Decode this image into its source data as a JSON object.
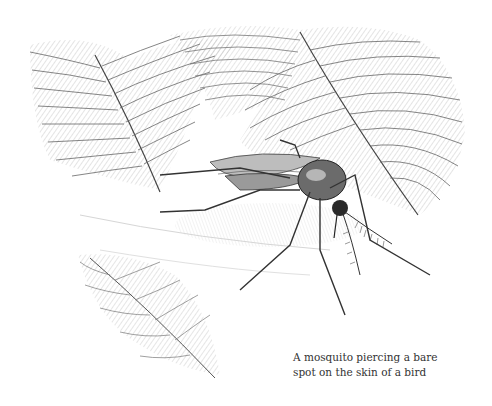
{
  "figure": {
    "caption": {
      "line1": "A mosquito piercing a bare",
      "line2": "spot on the skin of a bird"
    },
    "colors": {
      "background": "#ffffff",
      "ink": "#333333",
      "shadow": "#bdbdbd"
    }
  }
}
